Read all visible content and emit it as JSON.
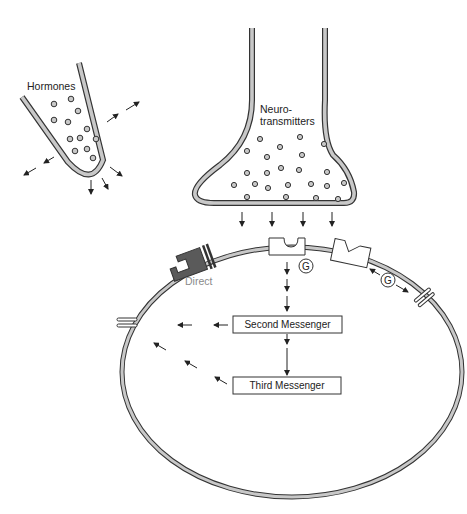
{
  "diagram": {
    "type": "cell-signaling",
    "labels": {
      "hormones": "Hormones",
      "neuro_line1": "Neuro-",
      "neuro_line2": "transmitters",
      "direct": "Direct",
      "second_messenger": "Second Messenger",
      "third_messenger": "Third Messenger",
      "g_protein_1": "G",
      "g_protein_2": "G"
    },
    "colors": {
      "membrane_fill": "#c8c8c8",
      "membrane_outline": "#333333",
      "direct_receptor": "#5a5a5a",
      "direct_label": "#8a8a8a",
      "text": "#222222"
    },
    "components": [
      "hormone-gland",
      "presynaptic-terminal",
      "postsynaptic-cell-membrane",
      "direct-receptor-channel",
      "second-messenger-receptor",
      "g-protein-receptor",
      "ion-channels"
    ]
  }
}
